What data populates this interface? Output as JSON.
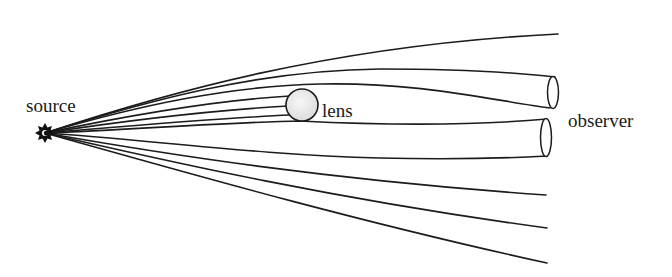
{
  "diagram": {
    "labels": {
      "source": "source",
      "lens": "lens",
      "observer": "observer"
    },
    "colors": {
      "background": "#ffffff",
      "line": "#1c1c1c",
      "lens_fill": "#ededed"
    },
    "elements": {
      "source": {
        "shape": "star",
        "x": 45,
        "y": 133
      },
      "lens": {
        "shape": "circle",
        "x": 302,
        "y": 105,
        "r": 16
      },
      "observer_images": 2,
      "ray_count": 12
    }
  }
}
